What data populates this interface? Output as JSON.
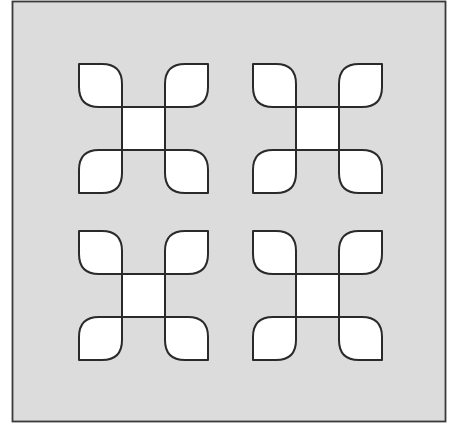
{
  "figure": {
    "width": 459,
    "height": 434,
    "background_color": "#ffffff"
  },
  "frame": {
    "x": 12.5,
    "y": 1.5,
    "width": 433,
    "height": 420,
    "fill": "#dcdcdc",
    "stroke": "#3a3a3a",
    "stroke_width": 1.8
  },
  "motif_style": {
    "fill": "#ffffff",
    "stroke": "#2a2a2a",
    "stroke_width": 2,
    "petal_size": 43,
    "center_size": 43,
    "corner_radius": 20
  },
  "motifs": [
    {
      "id": "top-left",
      "x": 79,
      "y": 64
    },
    {
      "id": "top-right",
      "x": 253,
      "y": 64
    },
    {
      "id": "bottom-left",
      "x": 79,
      "y": 231
    },
    {
      "id": "bottom-right",
      "x": 253,
      "y": 231
    }
  ],
  "layout": {
    "rows": 2,
    "columns": 2
  }
}
